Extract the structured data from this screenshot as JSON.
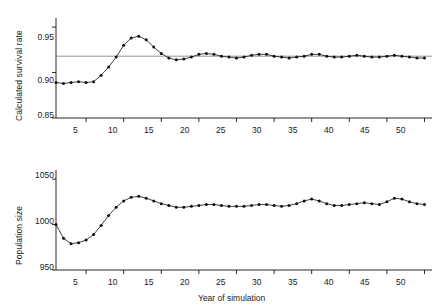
{
  "figure": {
    "background": "#ffffff",
    "ink": "#111111",
    "marker_color": "#111111",
    "reference_line_color": "#777777"
  },
  "chart_data": [
    {
      "type": "line",
      "id": "survival-rate-panel",
      "title": "",
      "xlabel": "",
      "ylabel": "Calculated survival rate",
      "xlim": [
        1,
        51
      ],
      "ylim": [
        0.85,
        0.96
      ],
      "yticks": [
        0.85,
        0.9,
        0.95
      ],
      "ytick_labels": [
        "0.85",
        "0.90",
        "0.95"
      ],
      "xticks": [
        5,
        10,
        15,
        20,
        25,
        30,
        35,
        40,
        45,
        50
      ],
      "xtick_labels": [
        "5",
        "10",
        "15",
        "20",
        "25",
        "30",
        "35",
        "40",
        "45",
        "50"
      ],
      "grid": false,
      "markers": "filled-circle",
      "reference_line_y": 0.918,
      "x": [
        1,
        2,
        3,
        4,
        5,
        6,
        7,
        8,
        9,
        10,
        11,
        12,
        13,
        14,
        15,
        16,
        17,
        18,
        19,
        20,
        21,
        22,
        23,
        24,
        25,
        26,
        27,
        28,
        29,
        30,
        31,
        32,
        33,
        34,
        35,
        36,
        37,
        38,
        39,
        40,
        41,
        42,
        43,
        44,
        45,
        46,
        47,
        48,
        49,
        50
      ],
      "values": [
        0.889,
        0.888,
        0.889,
        0.89,
        0.889,
        0.89,
        0.897,
        0.906,
        0.917,
        0.93,
        0.938,
        0.94,
        0.936,
        0.928,
        0.921,
        0.916,
        0.914,
        0.915,
        0.917,
        0.92,
        0.921,
        0.92,
        0.918,
        0.917,
        0.916,
        0.917,
        0.919,
        0.92,
        0.92,
        0.918,
        0.917,
        0.916,
        0.917,
        0.918,
        0.92,
        0.92,
        0.918,
        0.917,
        0.917,
        0.918,
        0.919,
        0.918,
        0.917,
        0.917,
        0.918,
        0.919,
        0.918,
        0.917,
        0.916,
        0.916
      ]
    },
    {
      "type": "line",
      "id": "population-size-panel",
      "title": "",
      "xlabel": "Year of simulation",
      "ylabel": "Population size",
      "xlim": [
        1,
        51
      ],
      "ylim": [
        950,
        1060
      ],
      "yticks": [
        950,
        1000,
        1050
      ],
      "ytick_labels": [
        "950",
        "1000",
        "1050"
      ],
      "xticks": [
        5,
        10,
        15,
        20,
        25,
        30,
        35,
        40,
        45,
        50
      ],
      "xtick_labels": [
        "5",
        "10",
        "15",
        "20",
        "25",
        "30",
        "35",
        "40",
        "45",
        "50"
      ],
      "grid": false,
      "markers": "filled-circle",
      "x": [
        1,
        2,
        3,
        4,
        5,
        6,
        7,
        8,
        9,
        10,
        11,
        12,
        13,
        14,
        15,
        16,
        17,
        18,
        19,
        20,
        21,
        22,
        23,
        24,
        25,
        26,
        27,
        28,
        29,
        30,
        31,
        32,
        33,
        34,
        35,
        36,
        37,
        38,
        39,
        40,
        41,
        42,
        43,
        44,
        45,
        46,
        47,
        48,
        49,
        50
      ],
      "values": [
        1000,
        985,
        979,
        980,
        983,
        989,
        999,
        1010,
        1019,
        1026,
        1030,
        1031,
        1029,
        1026,
        1023,
        1021,
        1019,
        1019,
        1020,
        1021,
        1022,
        1022,
        1021,
        1020,
        1020,
        1020,
        1021,
        1022,
        1022,
        1021,
        1020,
        1021,
        1023,
        1026,
        1028,
        1026,
        1023,
        1021,
        1021,
        1022,
        1023,
        1024,
        1023,
        1022,
        1025,
        1029,
        1028,
        1025,
        1023,
        1022
      ]
    }
  ]
}
